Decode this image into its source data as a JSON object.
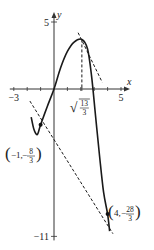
{
  "chart_data": {
    "type": "line",
    "title": "",
    "xlabel": "x",
    "ylabel": "y",
    "xlim": [
      -3,
      5
    ],
    "ylim": [
      -11,
      5
    ],
    "x_ticks": [
      {
        "value": -3,
        "label": "−3"
      },
      {
        "value": 5,
        "label": "5"
      }
    ],
    "y_ticks": [
      {
        "value": 5,
        "label": "5"
      },
      {
        "value": -11,
        "label": "−11"
      }
    ],
    "grid": false,
    "series": [
      {
        "name": "curve",
        "style": "solid",
        "points": [
          [
            -1.7,
            -2.1
          ],
          [
            -1.5,
            -3.0
          ],
          [
            -1.25,
            -3.4
          ],
          [
            -1,
            -2.67
          ],
          [
            -0.5,
            -1.3
          ],
          [
            0,
            0
          ],
          [
            0.5,
            1.6
          ],
          [
            1,
            2.8
          ],
          [
            1.5,
            3.5
          ],
          [
            2.08,
            3.7
          ],
          [
            2.5,
            3.0
          ],
          [
            2.8,
            1.0
          ],
          [
            3.1,
            -2.0
          ],
          [
            3.4,
            -5.0
          ],
          [
            3.7,
            -7.7
          ],
          [
            4,
            -9.33
          ],
          [
            4.15,
            -10.6
          ]
        ]
      },
      {
        "name": "tangent-at-max-region",
        "style": "dashed",
        "points": [
          [
            1.8,
            4.2
          ],
          [
            3.6,
            0.5
          ]
        ]
      },
      {
        "name": "secant-line",
        "style": "dashed",
        "points": [
          [
            -1.8,
            -0.9
          ],
          [
            4.4,
            -10.8
          ]
        ]
      },
      {
        "name": "vertical-guide",
        "style": "dashed",
        "points": [
          [
            2.08,
            3.7
          ],
          [
            2.08,
            0
          ]
        ]
      }
    ],
    "marked_points": [
      {
        "x": -1,
        "y": -2.667,
        "label_x": "−1",
        "label_y_num": "8",
        "label_y_den": "3",
        "label_y_sign": "−"
      },
      {
        "x": 4,
        "y": -9.333,
        "label_x": "4",
        "label_y_num": "28",
        "label_y_den": "3",
        "label_y_sign": "−"
      }
    ],
    "annotations": [
      {
        "x": 2.08,
        "text_num": "13",
        "text_den": "3",
        "text_root": "√"
      }
    ]
  }
}
